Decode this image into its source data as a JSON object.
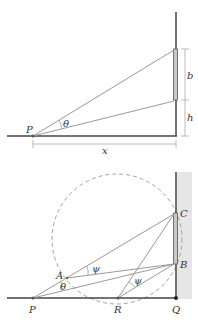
{
  "top_figure": {
    "labels": {
      "point_p": "P",
      "angle_theta": "θ",
      "dim_b": "b",
      "dim_h": "h",
      "dim_x": "x"
    }
  },
  "bottom_figure": {
    "labels": {
      "point_p": "P",
      "point_r": "R",
      "point_q": "Q",
      "point_a": "A",
      "point_b": "B",
      "point_c": "C",
      "angle_theta": "θ",
      "angle_psi_1": "ψ",
      "angle_psi_2": "ψ"
    }
  },
  "colors": {
    "line": "#9a9a9a",
    "wall": "#444444",
    "board": "#c8c8c8",
    "hatch": "#e4e4e4",
    "dashed_circle": "#999999"
  }
}
